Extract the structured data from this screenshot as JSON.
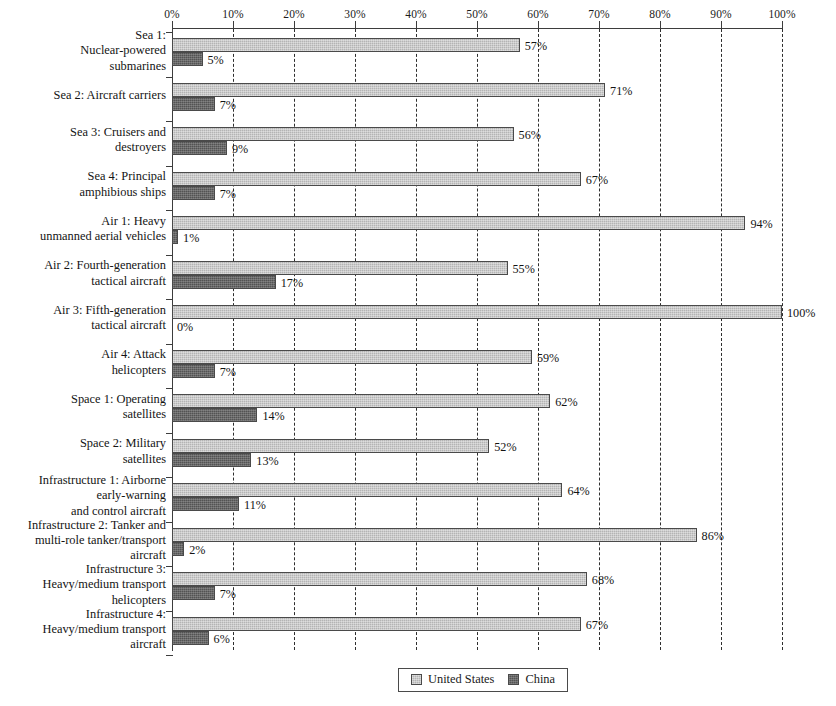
{
  "chart_data": {
    "type": "bar",
    "orientation": "horizontal",
    "title": "",
    "xlabel": "",
    "ylabel": "",
    "xlim": [
      0,
      100
    ],
    "xtick_labels": [
      "0%",
      "10%",
      "20%",
      "30%",
      "40%",
      "50%",
      "60%",
      "70%",
      "80%",
      "90%",
      "100%"
    ],
    "xticks": [
      0,
      10,
      20,
      30,
      40,
      50,
      60,
      70,
      80,
      90,
      100
    ],
    "grid": "vertical-dashed",
    "legend_position": "bottom-center",
    "legend": [
      "United States",
      "China"
    ],
    "categories": [
      "Sea 1:\nNuclear-powered\nsubmarines",
      "Sea 2: Aircraft carriers",
      "Sea 3: Cruisers and\ndestroyers",
      "Sea 4: Principal\namphibious ships",
      "Air 1: Heavy\nunmanned aerial vehicles",
      "Air 2: Fourth-generation\ntactical aircraft",
      "Air 3: Fifth-generation\ntactical aircraft",
      "Air 4: Attack\nhelicopters",
      "Space 1: Operating\nsatellites",
      "Space 2: Military\nsatellites",
      "Infrastructure 1: Airborne\nearly-warning\nand control aircraft",
      "Infrastructure 2: Tanker and\nmulti-role tanker/transport\naircraft",
      "Infrastructure 3:\nHeavy/medium transport\nhelicopters",
      "Infrastructure 4:\nHeavy/medium transport\naircraft"
    ],
    "series": [
      {
        "name": "United States",
        "color": "#b4b4b4",
        "values": [
          57,
          71,
          56,
          67,
          94,
          55,
          100,
          59,
          62,
          52,
          64,
          86,
          68,
          67
        ],
        "labels": [
          "57%",
          "71%",
          "56%",
          "67%",
          "94%",
          "55%",
          "100%",
          "59%",
          "62%",
          "52%",
          "64%",
          "86%",
          "68%",
          "67%"
        ]
      },
      {
        "name": "China",
        "color": "#535353",
        "values": [
          5,
          7,
          9,
          7,
          1,
          17,
          0,
          7,
          14,
          13,
          11,
          2,
          7,
          6
        ],
        "labels": [
          "5%",
          "7%",
          "9%",
          "7%",
          "1%",
          "17%",
          "0%",
          "7%",
          "14%",
          "13%",
          "11%",
          "2%",
          "7%",
          "6%"
        ]
      }
    ]
  },
  "legend": {
    "united_states_label": "United States",
    "china_label": "China"
  }
}
